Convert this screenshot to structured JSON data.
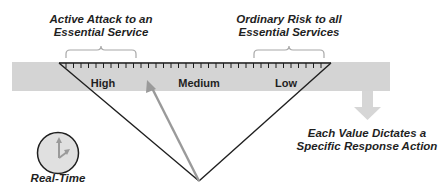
{
  "diagram": {
    "top_left_caption": {
      "line1": "Active Attack to an",
      "line2": "Essential Service"
    },
    "top_right_caption": {
      "line1": "Ordinary Risk to all",
      "line2": "Essential Services"
    },
    "scale_levels": [
      {
        "label": "High"
      },
      {
        "label": "Medium"
      },
      {
        "label": "Low"
      }
    ],
    "action_caption": {
      "line1": "Each Value Dictates a",
      "line2": "Specific Response Action"
    },
    "clock_caption": "Real-Time",
    "icons": {
      "clock": "clock-icon",
      "down_arrow": "arrow-down-icon",
      "needle": "gauge-needle-icon",
      "brace_left": "curly-brace-icon",
      "brace_right": "curly-brace-icon"
    },
    "colors": {
      "band": "#d4d4d4",
      "needle": "#9a9a9a",
      "lines": "#1f1f1f",
      "brace": "#a8a8a8",
      "clock_face": "#e0e0e0",
      "arrow": "#d6d6d6"
    }
  }
}
